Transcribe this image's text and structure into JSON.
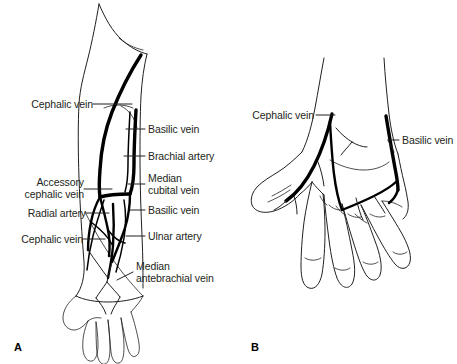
{
  "figure": {
    "background_color": "#ffffff",
    "ink_color": "#231f20",
    "panels": [
      {
        "letter": "A",
        "name": "anterior-forearm-veins",
        "labels_left": [
          {
            "id": "cephalic-vein-upper",
            "text": "Cephalic vein"
          },
          {
            "id": "accessory-cephalic-vein",
            "text": "Accessory\ncephalic vein"
          },
          {
            "id": "radial-artery",
            "text": "Radial artery"
          },
          {
            "id": "cephalic-vein-lower",
            "text": "Cephalic vein"
          }
        ],
        "labels_right": [
          {
            "id": "basilic-vein-upper",
            "text": "Basilic vein"
          },
          {
            "id": "brachial-artery",
            "text": "Brachial artery"
          },
          {
            "id": "median-cubital-vein",
            "text": "Median\ncubital vein"
          },
          {
            "id": "basilic-vein-lower",
            "text": "Basilic vein"
          },
          {
            "id": "ulnar-artery",
            "text": "Ulnar artery"
          },
          {
            "id": "median-antebrachial-vein",
            "text": "Median\nantebrachial vein"
          }
        ]
      },
      {
        "letter": "B",
        "name": "dorsal-hand-veins",
        "labels_left": [
          {
            "id": "cephalic-vein-hand",
            "text": "Cephalic vein"
          }
        ],
        "labels_right": [
          {
            "id": "basilic-vein-hand",
            "text": "Basilic vein"
          }
        ]
      }
    ]
  }
}
